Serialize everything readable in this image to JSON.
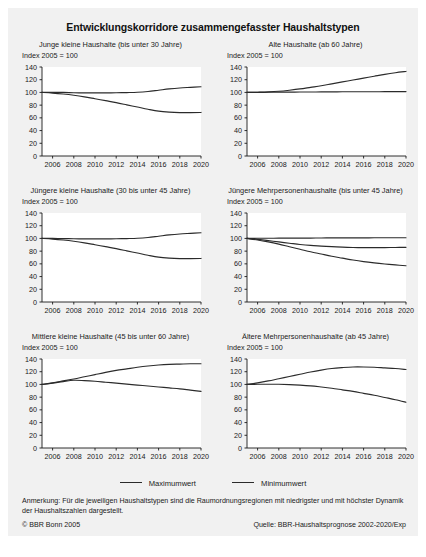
{
  "title": "Entwicklungskorridore zusammengefasster Haushaltstypen",
  "legend": {
    "items": [
      {
        "label": "Maximumwert",
        "color": "#2b2b2b"
      },
      {
        "label": "Minimumwert",
        "color": "#2b2b2b"
      }
    ]
  },
  "note": "Anmerkung: Für die jeweiligen Haushaltstypen sind die Raumordnungsregionen mit niedrigster und mit höchster Dynamik der Haushaltszahlen dargestellt.",
  "copyright": "© BBR Bonn 2005",
  "source": "Quelle: BBR-Haushaltsprognose 2002-2020/Exp",
  "axis": {
    "ylabel_note": "Index 2005 = 100",
    "yticks": [
      0,
      20,
      40,
      60,
      80,
      100,
      120,
      140
    ],
    "xticks": [
      2006,
      2008,
      2010,
      2012,
      2014,
      2016,
      2018,
      2020
    ],
    "xlim": [
      2005,
      2020
    ],
    "ylim": [
      0,
      140
    ]
  },
  "chart_data": [
    {
      "type": "line",
      "title": "Junge kleine Haushalte (bis unter 30 Jahre)",
      "subtitle": "Index 2005 = 100",
      "xlabel": "",
      "ylabel": "Index 2005 = 100",
      "xlim": [
        2005,
        2020
      ],
      "ylim": [
        0,
        140
      ],
      "grid": false,
      "legend_position": "figure-bottom",
      "x": [
        2005,
        2006,
        2007,
        2008,
        2009,
        2010,
        2011,
        2012,
        2013,
        2014,
        2015,
        2016,
        2017,
        2018,
        2019,
        2020
      ],
      "series": [
        {
          "name": "Maximumwert",
          "values": [
            100,
            100,
            100,
            99.5,
            99.3,
            99.2,
            99.3,
            99.5,
            99.8,
            100.3,
            101.5,
            103.5,
            105.5,
            107,
            108,
            109
          ]
        },
        {
          "name": "Minimumwert",
          "values": [
            100,
            99,
            97.5,
            95.5,
            93,
            90,
            87,
            84,
            80.5,
            77,
            73.5,
            70.5,
            69,
            68.3,
            68.2,
            68.5
          ]
        }
      ]
    },
    {
      "type": "line",
      "title": "Alte Haushalte (ab 60 Jahre)",
      "subtitle": "Index 2005 = 100",
      "xlabel": "",
      "ylabel": "Index 2005 = 100",
      "xlim": [
        2005,
        2020
      ],
      "ylim": [
        0,
        140
      ],
      "grid": false,
      "legend_position": "figure-bottom",
      "x": [
        2005,
        2006,
        2007,
        2008,
        2009,
        2010,
        2011,
        2012,
        2013,
        2014,
        2015,
        2016,
        2017,
        2018,
        2019,
        2020
      ],
      "series": [
        {
          "name": "Maximumwert",
          "values": [
            100,
            100.3,
            100.8,
            101.8,
            103.5,
            105.5,
            108,
            110.5,
            113.5,
            116.5,
            119.5,
            122.5,
            125.5,
            128.5,
            131,
            133
          ]
        },
        {
          "name": "Minimumwert",
          "values": [
            100,
            100.1,
            100.2,
            100.4,
            100.5,
            100.6,
            100.7,
            100.8,
            100.9,
            101,
            101,
            101.1,
            101.1,
            101.2,
            101.2,
            101.3
          ]
        }
      ]
    },
    {
      "type": "line",
      "title": "Jüngere kleine Haushalte (30 bis unter 45 Jahre)",
      "subtitle": "Index 2005 = 100",
      "xlabel": "",
      "ylabel": "Index 2005 = 100",
      "xlim": [
        2005,
        2020
      ],
      "ylim": [
        0,
        140
      ],
      "grid": false,
      "legend_position": "figure-bottom",
      "x": [
        2005,
        2006,
        2007,
        2008,
        2009,
        2010,
        2011,
        2012,
        2013,
        2014,
        2015,
        2016,
        2017,
        2018,
        2019,
        2020
      ],
      "series": [
        {
          "name": "Maximumwert",
          "values": [
            100,
            100,
            99.8,
            99.5,
            99.3,
            99.2,
            99.3,
            99.5,
            99.8,
            100.3,
            101.5,
            103.5,
            105.5,
            107,
            108,
            109
          ]
        },
        {
          "name": "Minimumwert",
          "values": [
            100,
            99,
            97.5,
            95.5,
            93,
            90,
            87,
            84,
            80.5,
            77,
            73.5,
            70.5,
            69,
            68.3,
            68.2,
            68.5
          ]
        }
      ]
    },
    {
      "type": "line",
      "title": "Jüngere Mehrpersonenhaushalte (bis unter 45 Jahre)",
      "subtitle": "Index 2005 = 100",
      "xlabel": "",
      "ylabel": "Index 2005 = 100",
      "xlim": [
        2005,
        2020
      ],
      "ylim": [
        0,
        140
      ],
      "grid": false,
      "legend_position": "figure-bottom",
      "x": [
        2005,
        2006,
        2007,
        2008,
        2009,
        2010,
        2011,
        2012,
        2013,
        2014,
        2015,
        2016,
        2017,
        2018,
        2019,
        2020
      ],
      "series": [
        {
          "name": "Maximumwert",
          "values": [
            100,
            100.2,
            100.3,
            100.4,
            100.5,
            100.6,
            100.6,
            100.7,
            100.8,
            100.8,
            100.9,
            100.9,
            101,
            101,
            101,
            101
          ]
        },
        {
          "name": "Minimumwert",
          "values": [
            100,
            98.5,
            96.5,
            94.5,
            92.5,
            90.5,
            89,
            88,
            87,
            86.3,
            85.8,
            85.5,
            85.5,
            85.6,
            85.8,
            86
          ]
        }
      ],
      "extra_series": [
        {
          "name": "Minimumwert-low",
          "values": [
            100,
            97.5,
            94.5,
            91,
            87,
            83,
            79,
            75.5,
            72,
            69,
            66,
            63.5,
            61.5,
            59.8,
            58.3,
            57
          ]
        }
      ]
    },
    {
      "type": "line",
      "title": "Mittlere kleine Haushalte (45 bis unter 60 Jahre)",
      "subtitle": "Index 2005 = 100",
      "xlabel": "",
      "ylabel": "Index 2005 = 100",
      "xlim": [
        2005,
        2020
      ],
      "ylim": [
        0,
        140
      ],
      "grid": false,
      "legend_position": "figure-bottom",
      "x": [
        2005,
        2006,
        2007,
        2008,
        2009,
        2010,
        2011,
        2012,
        2013,
        2014,
        2015,
        2016,
        2017,
        2018,
        2019,
        2020
      ],
      "series": [
        {
          "name": "Maximumwert",
          "values": [
            100,
            102.5,
            105.5,
            108.5,
            112,
            115.5,
            119,
            122,
            124.5,
            127,
            129,
            130.5,
            131.5,
            132,
            132.5,
            132.5
          ]
        },
        {
          "name": "Minimumwert",
          "values": [
            100,
            102,
            104.5,
            106.5,
            106,
            105,
            103.5,
            102,
            100.5,
            99,
            97.5,
            96,
            94.5,
            93,
            91,
            89
          ]
        }
      ]
    },
    {
      "type": "line",
      "title": "Ältere Mehrpersonenhaushalte (ab 45 Jahre)",
      "subtitle": "Index 2005 = 100",
      "xlabel": "",
      "ylabel": "Index 2005 = 100",
      "xlim": [
        2005,
        2020
      ],
      "ylim": [
        0,
        140
      ],
      "grid": false,
      "legend_position": "figure-bottom",
      "x": [
        2005,
        2006,
        2007,
        2008,
        2009,
        2010,
        2011,
        2012,
        2013,
        2014,
        2015,
        2016,
        2017,
        2018,
        2019,
        2020
      ],
      "series": [
        {
          "name": "Maximumwert",
          "values": [
            100,
            102.5,
            105.5,
            109,
            112.5,
            116,
            119.5,
            122.5,
            125,
            126.5,
            127.5,
            127.5,
            127,
            126,
            125,
            123.5
          ]
        },
        {
          "name": "Minimumwert",
          "values": [
            100,
            100.2,
            100.3,
            100.2,
            99.8,
            99,
            97.8,
            96,
            94,
            91.5,
            89,
            86,
            83,
            79.5,
            76,
            72
          ]
        }
      ]
    }
  ]
}
